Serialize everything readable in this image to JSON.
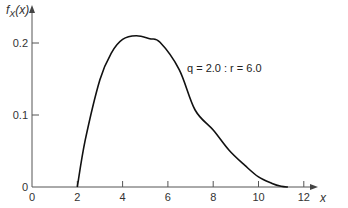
{
  "chart_data": {
    "type": "line",
    "title": "",
    "xlabel": "x",
    "ylabel": "f_X(x)",
    "xlim": [
      0,
      13
    ],
    "ylim": [
      0,
      0.23
    ],
    "x_ticks": [
      0,
      2,
      4,
      6,
      8,
      10,
      12
    ],
    "x_tick_labels": [
      "0",
      "2",
      "4",
      "6",
      "8",
      "10",
      "12"
    ],
    "y_ticks": [
      0,
      0.1,
      0.2
    ],
    "y_tick_labels": [
      "0",
      "0.1",
      "0.2"
    ],
    "grid": false,
    "legend": null,
    "annotations": [
      {
        "text": "q = 2.0 : r = 6.0",
        "x": 6.9,
        "y": 0.17
      }
    ],
    "series": [
      {
        "name": "q = 2.0 : r = 6.0",
        "x": [
          2.0,
          2.35,
          3.0,
          3.5,
          4.0,
          4.6,
          5.2,
          5.65,
          6.5,
          7.2,
          8.0,
          8.7,
          9.4,
          10.0,
          10.6,
          11.0,
          11.3
        ],
        "values": [
          0.0,
          0.065,
          0.149,
          0.186,
          0.205,
          0.21,
          0.206,
          0.201,
          0.163,
          0.107,
          0.079,
          0.051,
          0.03,
          0.014,
          0.005,
          0.001,
          0.0
        ]
      }
    ]
  },
  "labels": {
    "ylabel_main": "f",
    "ylabel_sub": "X",
    "ylabel_arg": "(x)",
    "xlabel": "x",
    "annotation": "q = 2.0 : r = 6.0"
  }
}
